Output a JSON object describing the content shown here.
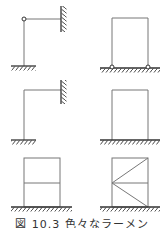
{
  "figure": {
    "caption": "図 10.3 色々なラーメン",
    "line_color": "#777777",
    "hatch_color": "#333333",
    "panels": [
      {
        "id": "a",
        "description": "L-frame, hinged knee, fixed base, fixed wall support"
      },
      {
        "id": "b",
        "description": "Portal frame, two pinned bases"
      },
      {
        "id": "c",
        "description": "L-frame, rigid knee, fixed base, fixed wall support"
      },
      {
        "id": "d",
        "description": "Portal frame, fixed bases"
      },
      {
        "id": "e",
        "description": "Two-story portal frame, fixed base"
      },
      {
        "id": "f",
        "description": "Two-story portal frame with diagonal bracing, fixed base"
      }
    ]
  }
}
